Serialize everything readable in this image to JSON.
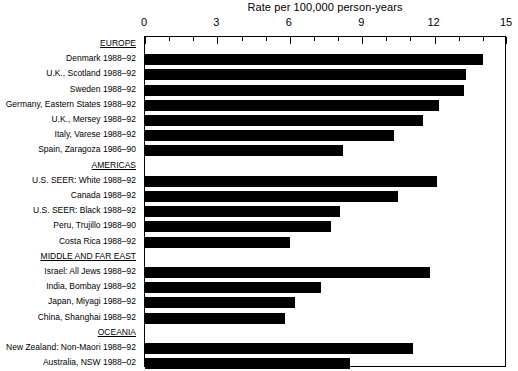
{
  "chart_data": {
    "type": "bar",
    "orientation": "horizontal",
    "title": "Rate per 100,000 person-years",
    "xlabel": "Rate per 100,000 person-years",
    "ylabel": "",
    "xlim": [
      0,
      15
    ],
    "xticks": [
      0,
      3,
      6,
      9,
      12,
      15
    ],
    "xtick_labels": [
      "0",
      "3",
      "6",
      "9",
      "12",
      "15"
    ],
    "minor_tick_interval": 1,
    "grid": false,
    "legend": "none",
    "bar_color": "#000000",
    "groups": [
      {
        "name": "EUROPE",
        "categories": [
          "Denmark 1988–92",
          "U.K., Scotland 1988–92",
          "Sweden 1988–92",
          "Germany, Eastern States 1988–92",
          "U.K., Mersey 1988–92",
          "Italy, Varese 1988–92",
          "Spain, Zaragoza 1986–90"
        ],
        "values": [
          14.0,
          13.3,
          13.2,
          12.2,
          11.5,
          10.3,
          8.2
        ]
      },
      {
        "name": "AMERICAS",
        "categories": [
          "U.S. SEER: White 1988–92",
          "Canada 1988–92",
          "U.S. SEER: Black 1988–92",
          "Peru, Trujillo 1988–90",
          "Costa Rica  1988–92"
        ],
        "values": [
          12.1,
          10.5,
          8.1,
          7.7,
          6.0
        ]
      },
      {
        "name": "MIDDLE AND FAR EAST",
        "categories": [
          "Israel: All Jews 1988–92",
          "India, Bombay 1988–92",
          "Japan, Miyagi 1988–92",
          "China, Shanghai 1988–92"
        ],
        "values": [
          11.8,
          7.3,
          6.2,
          5.8
        ]
      },
      {
        "name": "OCEANIA",
        "categories": [
          "New Zealand: Non-Maori 1988–92",
          "Australia, NSW 1988–02"
        ],
        "values": [
          11.1,
          8.5
        ]
      }
    ]
  }
}
